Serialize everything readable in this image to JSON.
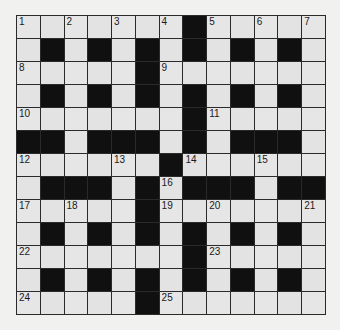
{
  "puzzle": {
    "rows": 13,
    "cols": 13,
    "layout": [
      "WWWWWWWBWWWWW",
      "WBWBWBWBWBWBW",
      "WWWWWBWWWWWWW",
      "WBWBWBWBWBWBW",
      "WWWWWWWBWWWWW",
      "BBWBBBWBWBBBW",
      "WWWWWWBWWWWWW",
      "WBBBWBWBBBWBB",
      "WWWWWBWWWWWWW",
      "WBWBWBWBWBWBW",
      "WWWWWWWBWWWWW",
      "WBWBWBWBWBWBW",
      "WWWWWBWWWWWWW"
    ],
    "numbers": [
      {
        "row": 0,
        "col": 0,
        "n": "1"
      },
      {
        "row": 0,
        "col": 2,
        "n": "2"
      },
      {
        "row": 0,
        "col": 4,
        "n": "3"
      },
      {
        "row": 0,
        "col": 6,
        "n": "4"
      },
      {
        "row": 0,
        "col": 8,
        "n": "5"
      },
      {
        "row": 0,
        "col": 10,
        "n": "6"
      },
      {
        "row": 0,
        "col": 12,
        "n": "7"
      },
      {
        "row": 2,
        "col": 0,
        "n": "8"
      },
      {
        "row": 2,
        "col": 6,
        "n": "9"
      },
      {
        "row": 4,
        "col": 0,
        "n": "10"
      },
      {
        "row": 4,
        "col": 8,
        "n": "11"
      },
      {
        "row": 6,
        "col": 0,
        "n": "12"
      },
      {
        "row": 6,
        "col": 4,
        "n": "13"
      },
      {
        "row": 6,
        "col": 7,
        "n": "14"
      },
      {
        "row": 6,
        "col": 10,
        "n": "15"
      },
      {
        "row": 7,
        "col": 6,
        "n": "16"
      },
      {
        "row": 8,
        "col": 0,
        "n": "17"
      },
      {
        "row": 8,
        "col": 2,
        "n": "18"
      },
      {
        "row": 8,
        "col": 6,
        "n": "19"
      },
      {
        "row": 8,
        "col": 8,
        "n": "20"
      },
      {
        "row": 8,
        "col": 12,
        "n": "21"
      },
      {
        "row": 10,
        "col": 0,
        "n": "22"
      },
      {
        "row": 10,
        "col": 8,
        "n": "23"
      },
      {
        "row": 12,
        "col": 0,
        "n": "24"
      },
      {
        "row": 12,
        "col": 6,
        "n": "25"
      }
    ],
    "colors": {
      "background": "#f1f1f0",
      "cell": "#e3e3e3",
      "block": "#101010",
      "border": "#2a2a2a"
    }
  }
}
